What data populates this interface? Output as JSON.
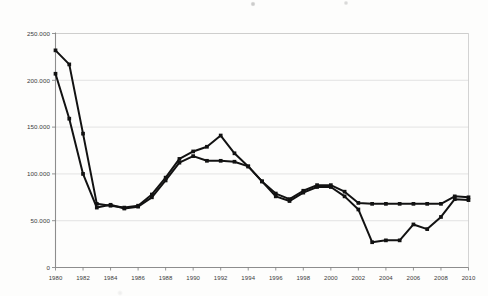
{
  "chart_data": {
    "type": "line",
    "title": "",
    "subtitle": "",
    "xlabel": "",
    "ylabel": "",
    "xlim": [
      1980,
      2010
    ],
    "ylim": [
      0,
      250000
    ],
    "grid": true,
    "legend": "none",
    "y_ticks": [
      0,
      50000,
      100000,
      150000,
      200000,
      250000
    ],
    "y_tick_labels": [
      "0",
      "50.000",
      "100.000",
      "150.000",
      "200.000",
      "250.000"
    ],
    "x_ticks": [
      1980,
      1982,
      1984,
      1986,
      1988,
      1990,
      1992,
      1994,
      1996,
      1998,
      2000,
      2002,
      2004,
      2006,
      2008,
      2010
    ],
    "x_tick_labels": [
      "1980",
      "1982",
      "1984",
      "1986",
      "1988",
      "1990",
      "1992",
      "1994",
      "1996",
      "1998",
      "2000",
      "2002",
      "2004",
      "2006",
      "2008",
      "2010"
    ],
    "marker": "square",
    "series_color": "#121212",
    "x": [
      1980,
      1981,
      1982,
      1983,
      1984,
      1985,
      1986,
      1987,
      1988,
      1989,
      1990,
      1991,
      1992,
      1993,
      1994,
      1995,
      1996,
      1997,
      1998,
      1999,
      2000,
      2001,
      2002,
      2003,
      2004,
      2005,
      2006,
      2007,
      2008,
      2009,
      2010
    ],
    "series": [
      {
        "name": "Series 1",
        "values": [
          232000,
          217000,
          143000,
          68000,
          66000,
          64000,
          66000,
          78000,
          96000,
          116000,
          124000,
          129000,
          141000,
          122000,
          108000,
          92000,
          79000,
          73000,
          82000,
          88000,
          88000,
          81000,
          69000,
          68000,
          68000,
          68000,
          68000,
          68000,
          68000,
          76000,
          75000
        ]
      },
      {
        "name": "Series 2",
        "values": [
          207000,
          159000,
          100000,
          64000,
          67000,
          63000,
          65000,
          75000,
          93000,
          112000,
          119000,
          114000,
          114000,
          113000,
          108000,
          92000,
          76000,
          71000,
          80000,
          86000,
          86000,
          76000,
          62000,
          27000,
          29000,
          29000,
          46000,
          41000,
          54000,
          73000,
          72000
        ]
      }
    ]
  }
}
